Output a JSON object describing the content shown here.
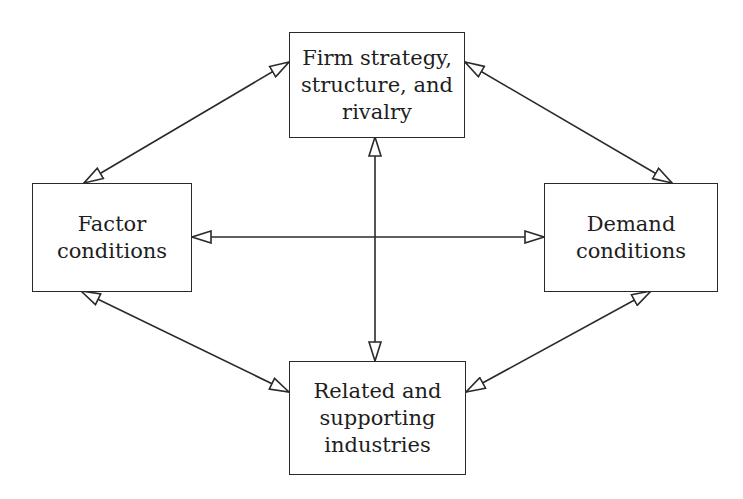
{
  "diagram": {
    "type": "Porter's Diamond",
    "nodes": [
      {
        "id": "firm",
        "lines": [
          "Firm strategy,",
          "structure, and",
          "rivalry"
        ]
      },
      {
        "id": "factor",
        "lines": [
          "Factor",
          "conditions"
        ]
      },
      {
        "id": "demand",
        "lines": [
          "Demand",
          "conditions"
        ]
      },
      {
        "id": "related",
        "lines": [
          "Related and",
          "supporting",
          "industries"
        ]
      }
    ],
    "edges": [
      {
        "from": "firm",
        "to": "factor",
        "style": "bidirectional-open-arrow"
      },
      {
        "from": "firm",
        "to": "demand",
        "style": "bidirectional-open-arrow"
      },
      {
        "from": "firm",
        "to": "related",
        "style": "bidirectional-open-arrow"
      },
      {
        "from": "factor",
        "to": "demand",
        "style": "bidirectional-open-arrow"
      },
      {
        "from": "factor",
        "to": "related",
        "style": "bidirectional-open-arrow"
      },
      {
        "from": "demand",
        "to": "related",
        "style": "bidirectional-open-arrow"
      }
    ],
    "colors": {
      "line": "#2a2a2a",
      "text": "#1e1e1e",
      "background": "#ffffff"
    }
  }
}
